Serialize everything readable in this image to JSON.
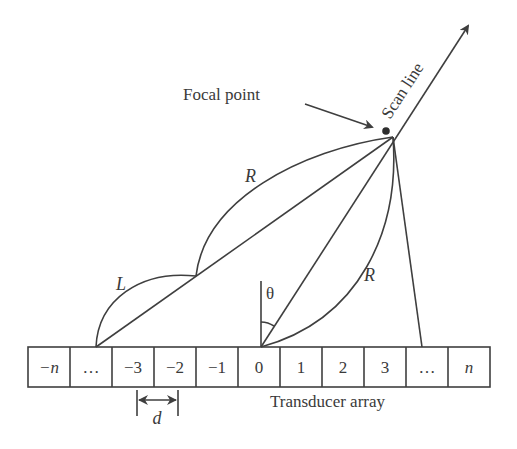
{
  "diagram": {
    "labels": {
      "focal_point": "Focal point",
      "scan_line": "Scan line",
      "transducer_array": "Transducer array",
      "arc_L": "L",
      "arc_R_upper": "R",
      "arc_R_lower": "R",
      "angle": "θ",
      "pitch": "d"
    },
    "array_elements": [
      "−n",
      "…",
      "−3",
      "−2",
      "−1",
      "0",
      "1",
      "2",
      "3",
      "…",
      "n"
    ],
    "colors": {
      "line": "#3f3f3f",
      "text": "#3a3a3a",
      "background": "#ffffff"
    }
  }
}
